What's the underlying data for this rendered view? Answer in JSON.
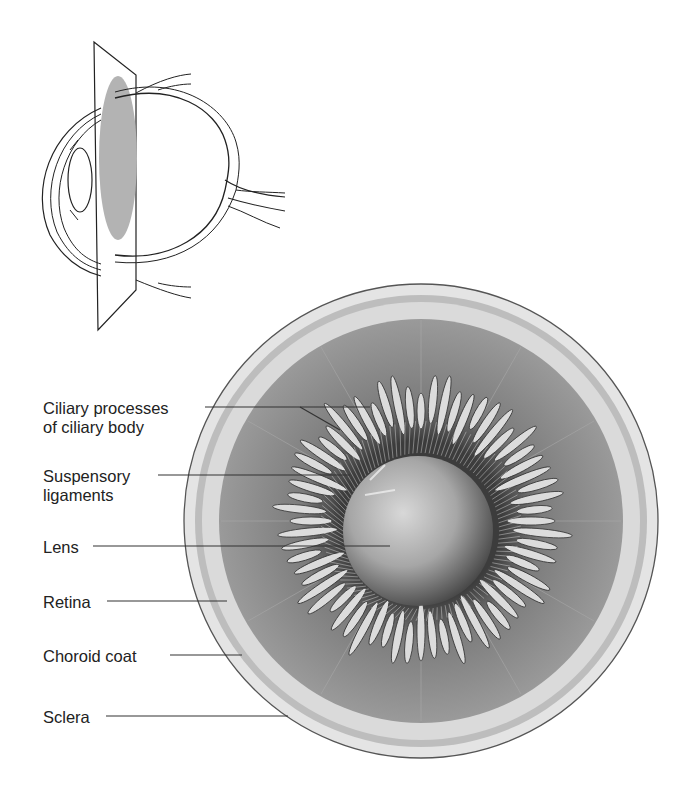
{
  "diagram": {
    "inset": {
      "description": "Sagittal eye outline with cutting plane",
      "plane_color": "#b0b0b0"
    },
    "labels": [
      {
        "id": "ciliary-processes",
        "line1": "Ciliary processes",
        "line2": "of ciliary body"
      },
      {
        "id": "suspensory-ligaments",
        "line1": "Suspensory",
        "line2": "ligaments"
      },
      {
        "id": "lens",
        "line1": "Lens"
      },
      {
        "id": "retina",
        "line1": "Retina"
      },
      {
        "id": "choroid-coat",
        "line1": "Choroid coat"
      },
      {
        "id": "sclera",
        "line1": "Sclera"
      }
    ],
    "colors": {
      "sclera": "#e6e6e6",
      "choroid": "#a8a8a8",
      "retina_band": "#d6d6d6",
      "ciliary_body": "#8c8c8c",
      "processes": "#d9d9d9",
      "lens": "#a0a0a0",
      "label_text": "#222222",
      "leader_line": "#333333"
    }
  }
}
